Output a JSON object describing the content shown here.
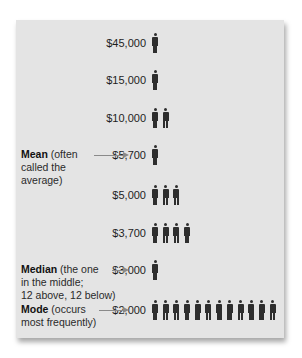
{
  "chart_data": {
    "type": "pictograph",
    "title": "",
    "unit_icon": "person-icon",
    "categories": [
      "$45,000",
      "$15,000",
      "$10,000",
      "$5,700",
      "$5,000",
      "$3,700",
      "$3,000",
      "$2,000"
    ],
    "values": [
      1,
      1,
      2,
      1,
      3,
      4,
      1,
      12
    ],
    "annotations": [
      {
        "target": "$5,700",
        "label": "Mean",
        "text": "(often called the average)"
      },
      {
        "target": "$3,000",
        "label": "Median",
        "text": "(the one in the middle; 12 above, 12 below)"
      },
      {
        "target": "$2,000",
        "label": "Mode",
        "text": "(occurs most frequently)"
      }
    ]
  },
  "rows": [
    {
      "value": "$45,000",
      "count": 1
    },
    {
      "value": "$15,000",
      "count": 1
    },
    {
      "value": "$10,000",
      "count": 2
    },
    {
      "value": "$5,700",
      "count": 1
    },
    {
      "value": "$5,000",
      "count": 3
    },
    {
      "value": "$3,700",
      "count": 4
    },
    {
      "value": "$3,000",
      "count": 1
    },
    {
      "value": "$2,000",
      "count": 12
    }
  ],
  "notes": {
    "mean": {
      "bold": "Mean",
      "line1": " (often",
      "line2": "called the",
      "line3": "average)"
    },
    "median": {
      "bold": "Median",
      "line1": " (the one",
      "line2": "in the middle;",
      "line3": "12 above, 12 below)"
    },
    "mode": {
      "bold": "Mode",
      "line1": " (occurs",
      "line2": "most frequently)"
    }
  },
  "colors": {
    "panel": "#e4e4e4",
    "icon": "#2e2e2e",
    "arrow": "#8a8a8a"
  }
}
